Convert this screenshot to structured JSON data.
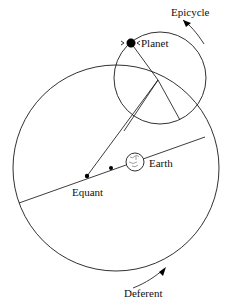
{
  "diagram": {
    "background_color": "#ffffff",
    "stroke_color": "#1a1a1a",
    "labels": {
      "epicycle": "Epicycle",
      "planet": "Planet",
      "earth": "Earth",
      "equant": "Equant",
      "deferent": "Deferent"
    },
    "elements": {
      "deferent_circle": {
        "name": "deferent-circle",
        "cx": 116,
        "cy": 168,
        "r": 103
      },
      "epicycle_circle": {
        "name": "epicycle-circle",
        "cx": 160,
        "cy": 78,
        "r": 46
      },
      "earth_circle": {
        "name": "earth-circle",
        "cx": 135,
        "cy": 162,
        "r": 9
      },
      "planet_point": {
        "name": "planet-point",
        "x": 131,
        "y": 43
      },
      "equant_point": {
        "name": "equant-point",
        "x": 87,
        "y": 176
      },
      "deferent_center_point": {
        "name": "deferent-center-point",
        "x": 111,
        "y": 168
      },
      "epicycle_center_point": {
        "name": "epicycle-center-point",
        "x": 158,
        "y": 80
      }
    },
    "label_positions": {
      "epicycle": {
        "x": 171,
        "y": 16
      },
      "planet": {
        "x": 141,
        "y": 47
      },
      "earth": {
        "x": 149,
        "y": 167
      },
      "equant": {
        "x": 72,
        "y": 196
      },
      "deferent": {
        "x": 124,
        "y": 297
      }
    },
    "arrows": {
      "epicycle_arrow": {
        "name": "epicycle-direction-arrow",
        "description": "counterclockwise curved arrow on upper right of epicycle",
        "path": "M 203 42 C 196 32 189 25 182 20",
        "tip_x": 180,
        "tip_y": 19,
        "angle_deg": 218
      },
      "deferent_arrow": {
        "name": "deferent-direction-arrow",
        "description": "curved arrow pointing up-right near bottom of deferent",
        "path": "M 133 288 C 146 283 156 276 164 269",
        "tip_x": 166,
        "tip_y": 267,
        "angle_deg": -42
      }
    },
    "lines": {
      "apsidal_line": {
        "name": "apsidal-line",
        "x1": 19,
        "y1": 203,
        "x2": 205,
        "y2": 137
      },
      "equant_to_epicycle": {
        "name": "equant-to-epicycle-line",
        "x1": 87,
        "y1": 176,
        "x2": 158,
        "y2": 80
      },
      "epicycle_center_to_planet": {
        "name": "epicycle-center-to-planet-line",
        "x1": 158,
        "y1": 80,
        "x2": 131,
        "y2": 43
      },
      "epicycle_center_to_lower_left": {
        "name": "epicycle-center-to-lower-left-line",
        "x1": 158,
        "y1": 80,
        "x2": 124,
        "y2": 131
      },
      "epicycle_center_to_lower_right": {
        "name": "epicycle-center-to-lower-right-line",
        "x1": 158,
        "y1": 80,
        "x2": 180,
        "y2": 120
      }
    }
  }
}
